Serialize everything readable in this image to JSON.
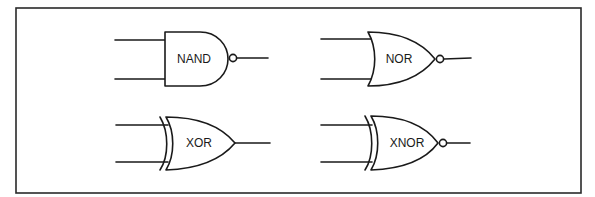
{
  "figure": {
    "gates": [
      {
        "id": "nand",
        "label": "NAND",
        "type": "and",
        "inverted": true
      },
      {
        "id": "nor",
        "label": "NOR",
        "type": "or",
        "inverted": true
      },
      {
        "id": "xor",
        "label": "XOR",
        "type": "xor",
        "inverted": false
      },
      {
        "id": "xnor",
        "label": "XNOR",
        "type": "xor",
        "inverted": true
      }
    ],
    "colors": {
      "line": "#1a1a1a",
      "background": "#ffffff",
      "frame": "#2a2a2a"
    }
  }
}
